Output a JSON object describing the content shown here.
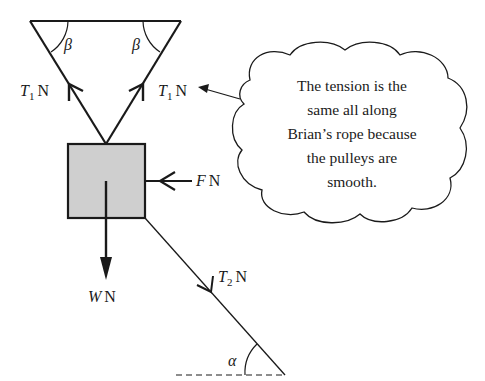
{
  "diagram": {
    "type": "force-diagram",
    "colors": {
      "stroke": "#1a1a1a",
      "box_fill": "#cfcfcf",
      "background": "#ffffff"
    },
    "support": {
      "shape": "inverted-triangle",
      "angle_labels": [
        "β",
        "β"
      ]
    },
    "forces": {
      "t1_left": {
        "symbol": "T",
        "subscript": "1",
        "unit": "N",
        "direction": "up-left along rope"
      },
      "t1_right": {
        "symbol": "T",
        "subscript": "1",
        "unit": "N",
        "direction": "up-right along rope"
      },
      "weight": {
        "symbol": "W",
        "unit": "N",
        "direction": "down"
      },
      "push": {
        "symbol": "F",
        "unit": "N",
        "direction": "left"
      },
      "t2": {
        "symbol": "T",
        "subscript": "2",
        "unit": "N",
        "direction": "down-right along rope"
      }
    },
    "angle_alpha": "α",
    "annotation": {
      "lines": [
        "The tension is the",
        "same all along",
        "Brian’s rope because",
        "the pulleys are",
        "smooth."
      ]
    }
  }
}
